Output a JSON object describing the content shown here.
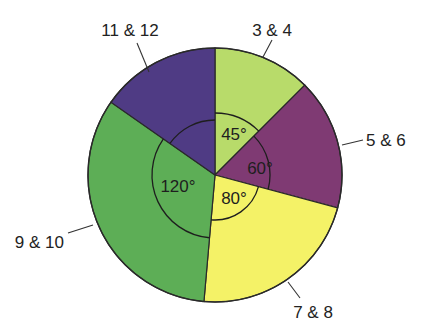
{
  "chart_data": {
    "type": "pie",
    "title": "",
    "start_angle_deg": 0,
    "direction": "clockwise",
    "slices": [
      {
        "label": "3 & 4",
        "angle_deg": 45,
        "angle_label": "45°",
        "color": "#b8db6a"
      },
      {
        "label": "5 & 6",
        "angle_deg": 60,
        "angle_label": "60°",
        "color": "#7f3a73"
      },
      {
        "label": "7 & 8",
        "angle_deg": 80,
        "angle_label": "80°",
        "color": "#f4f267"
      },
      {
        "label": "9 & 10",
        "angle_deg": 120,
        "angle_label": "120°",
        "color": "#5dae56"
      },
      {
        "label": "11 & 12",
        "angle_deg": 55,
        "angle_label": "",
        "color": "#4f3b84"
      }
    ],
    "values": [
      45,
      60,
      80,
      120,
      55
    ],
    "categories": [
      "3 & 4",
      "5 & 6",
      "7 & 8",
      "9 & 10",
      "11 & 12"
    ],
    "legend": "none (labels placed outside with leader lines)"
  },
  "geometry": {
    "cx": 215,
    "cy": 175,
    "r": 127,
    "arc_radii": [
      62,
      55,
      45,
      63,
      55
    ],
    "label_positions": [
      {
        "x": 272,
        "y": 36,
        "anchor": "middle",
        "leader": [
          263,
          57,
          272,
          40
        ]
      },
      {
        "x": 366,
        "y": 146,
        "anchor": "start",
        "leader": [
          342,
          145,
          363,
          140
        ]
      },
      {
        "x": 313,
        "y": 318,
        "anchor": "middle",
        "leader": [
          288,
          282,
          300,
          298
        ]
      },
      {
        "x": 64,
        "y": 248,
        "anchor": "end",
        "leader": [
          93,
          225,
          68,
          233
        ]
      },
      {
        "x": 130,
        "y": 36,
        "anchor": "middle",
        "leader": [
          149,
          72,
          137,
          43
        ]
      }
    ],
    "angle_label_positions": [
      {
        "x": 234,
        "y": 140
      },
      {
        "x": 260,
        "y": 174
      },
      {
        "x": 234,
        "y": 204
      },
      {
        "x": 178,
        "y": 192
      },
      null
    ]
  }
}
